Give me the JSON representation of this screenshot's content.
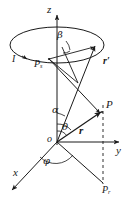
{
  "figure": {
    "type": "3d-vector-diagram",
    "stroke_color": "#1a1a1a",
    "background_color": "#ffffff",
    "width": 128,
    "height": 206
  },
  "axes": {
    "z": {
      "label": "z",
      "x": 47,
      "y": 6,
      "direction": "up"
    },
    "y": {
      "label": "y",
      "x": 116,
      "y": 146,
      "direction": "right"
    },
    "x": {
      "label": "x",
      "x": 13,
      "y": 169,
      "direction": "lower-left"
    },
    "origin": {
      "label": "o",
      "x": 48,
      "y": 138
    }
  },
  "points": {
    "source": {
      "label": "P",
      "sub": "s",
      "x": 34,
      "y": 60
    },
    "field": {
      "label": "P",
      "sub": "",
      "x": 106,
      "y": 101
    },
    "projection": {
      "label": "P",
      "sub": "r",
      "x": 105,
      "y": 186
    }
  },
  "vectors": {
    "r_prime": {
      "label": "r",
      "prime": "′",
      "x": 103,
      "y": 59
    },
    "r": {
      "label": "r",
      "prime": "",
      "x": 80,
      "y": 127
    },
    "current": {
      "label": "I",
      "x": 13,
      "y": 56
    }
  },
  "angles": {
    "beta": {
      "label": "β",
      "x": 57,
      "y": 33
    },
    "alpha": {
      "label": "α",
      "x": 53,
      "y": 108
    },
    "theta": {
      "label": "θ",
      "x": 62,
      "y": 125
    },
    "phi": {
      "label": "φ",
      "x": 44,
      "y": 158
    }
  }
}
